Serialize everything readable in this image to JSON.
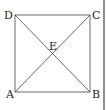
{
  "diagram": {
    "type": "square-with-diagonals",
    "labels": {
      "A": "A",
      "B": "B",
      "C": "C",
      "D": "D",
      "E": "E"
    },
    "stroke_color": "#333333"
  }
}
